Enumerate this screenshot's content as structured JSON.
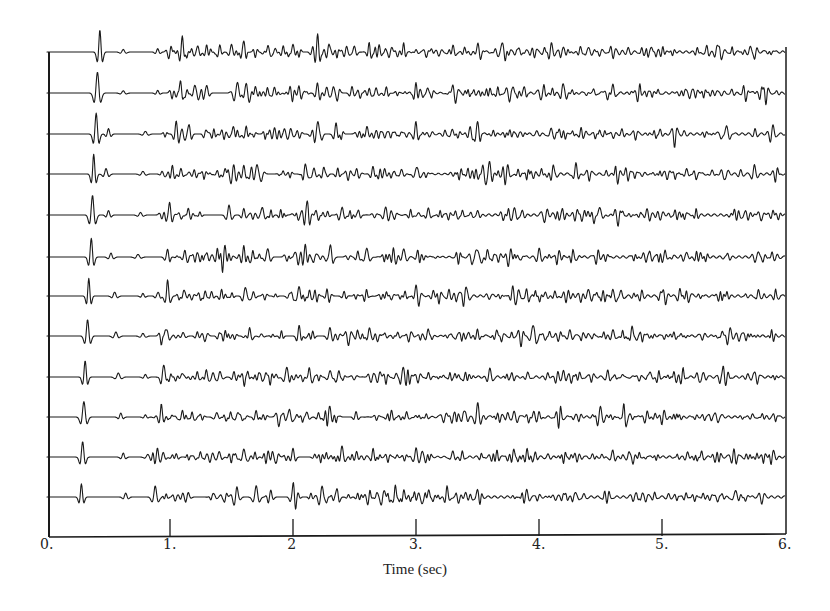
{
  "chart_data": {
    "type": "line",
    "title": "",
    "xlabel": "Time (sec)",
    "ylabel": "",
    "xlim": [
      0,
      6
    ],
    "x_ticks": [
      0,
      1,
      2,
      3,
      4,
      5,
      6
    ],
    "x_tick_labels": [
      "0.",
      "1.",
      "2",
      "3.",
      "4.",
      "5.",
      "6."
    ],
    "grid": false,
    "legend": null,
    "trace_count": 12,
    "traces": [
      {
        "index": 1,
        "first_arrival": 0.43,
        "events": [
          [
            0.43,
            1.0
          ],
          [
            0.62,
            0.12
          ],
          [
            0.9,
            0.15
          ],
          [
            1.1,
            0.75
          ],
          [
            1.22,
            0.25
          ],
          [
            1.3,
            0.25
          ],
          [
            1.5,
            0.35
          ],
          [
            1.6,
            0.35
          ],
          [
            1.8,
            0.3
          ],
          [
            1.92,
            0.3
          ],
          [
            2.0,
            0.35
          ],
          [
            2.2,
            0.8
          ],
          [
            2.3,
            0.3
          ],
          [
            2.5,
            0.3
          ],
          [
            2.7,
            0.35
          ],
          [
            3.3,
            0.4
          ],
          [
            3.5,
            0.3
          ],
          [
            3.7,
            0.35
          ],
          [
            4.1,
            0.3
          ],
          [
            4.4,
            0.35
          ]
        ]
      },
      {
        "index": 2,
        "first_arrival": 0.41,
        "events": [
          [
            0.41,
            0.95
          ],
          [
            0.62,
            0.1
          ],
          [
            0.9,
            0.12
          ],
          [
            1.08,
            0.6
          ],
          [
            1.2,
            0.3
          ],
          [
            1.3,
            0.3
          ],
          [
            1.55,
            0.45
          ],
          [
            1.62,
            0.35
          ],
          [
            1.85,
            0.3
          ],
          [
            2.05,
            0.3
          ],
          [
            2.2,
            0.45
          ],
          [
            2.48,
            0.3
          ],
          [
            3.0,
            0.45
          ],
          [
            3.3,
            0.3
          ],
          [
            3.6,
            0.3
          ],
          [
            4.2,
            0.35
          ],
          [
            4.6,
            0.4
          ]
        ]
      },
      {
        "index": 3,
        "first_arrival": 0.4,
        "events": [
          [
            0.4,
            0.95
          ],
          [
            0.5,
            0.25
          ],
          [
            0.8,
            0.12
          ],
          [
            1.05,
            0.55
          ],
          [
            1.15,
            0.25
          ],
          [
            1.3,
            0.25
          ],
          [
            1.52,
            0.45
          ],
          [
            1.62,
            0.4
          ],
          [
            1.85,
            0.3
          ],
          [
            2.2,
            0.6
          ],
          [
            2.35,
            0.35
          ],
          [
            2.6,
            0.35
          ],
          [
            3.0,
            0.35
          ],
          [
            3.5,
            0.35
          ],
          [
            4.1,
            0.3
          ],
          [
            5.9,
            0.35
          ]
        ]
      },
      {
        "index": 4,
        "first_arrival": 0.38,
        "events": [
          [
            0.38,
            0.9
          ],
          [
            0.48,
            0.25
          ],
          [
            0.78,
            0.12
          ],
          [
            1.02,
            0.5
          ],
          [
            1.2,
            0.25
          ],
          [
            1.45,
            0.3
          ],
          [
            1.6,
            0.4
          ],
          [
            1.7,
            0.35
          ],
          [
            2.1,
            0.35
          ],
          [
            2.25,
            0.4
          ],
          [
            2.65,
            0.35
          ],
          [
            3.0,
            0.35
          ],
          [
            3.6,
            0.35
          ],
          [
            4.3,
            0.3
          ],
          [
            5.2,
            0.3
          ]
        ]
      },
      {
        "index": 5,
        "first_arrival": 0.37,
        "events": [
          [
            0.37,
            0.9
          ],
          [
            0.5,
            0.2
          ],
          [
            0.76,
            0.12
          ],
          [
            1.0,
            0.45
          ],
          [
            1.15,
            0.25
          ],
          [
            1.48,
            0.45
          ],
          [
            1.6,
            0.3
          ],
          [
            1.75,
            0.4
          ],
          [
            2.12,
            0.55
          ],
          [
            2.4,
            0.35
          ],
          [
            2.75,
            0.35
          ],
          [
            3.1,
            0.35
          ],
          [
            3.8,
            0.4
          ],
          [
            4.5,
            0.3
          ]
        ]
      },
      {
        "index": 6,
        "first_arrival": 0.36,
        "events": [
          [
            0.36,
            0.85
          ],
          [
            0.52,
            0.18
          ],
          [
            0.74,
            0.12
          ],
          [
            0.98,
            0.45
          ],
          [
            1.12,
            0.25
          ],
          [
            1.45,
            0.35
          ],
          [
            1.6,
            0.3
          ],
          [
            1.8,
            0.35
          ],
          [
            2.1,
            0.6
          ],
          [
            2.3,
            0.35
          ],
          [
            2.6,
            0.4
          ],
          [
            2.9,
            0.35
          ],
          [
            3.5,
            0.4
          ],
          [
            4.0,
            0.35
          ],
          [
            4.9,
            0.3
          ]
        ]
      },
      {
        "index": 7,
        "first_arrival": 0.34,
        "events": [
          [
            0.34,
            0.8
          ],
          [
            0.55,
            0.18
          ],
          [
            0.78,
            0.12
          ],
          [
            0.98,
            0.45
          ],
          [
            1.12,
            0.25
          ],
          [
            1.42,
            0.35
          ],
          [
            1.62,
            0.3
          ],
          [
            2.05,
            0.45
          ],
          [
            2.28,
            0.35
          ],
          [
            2.6,
            0.4
          ],
          [
            3.0,
            0.4
          ],
          [
            3.4,
            0.35
          ],
          [
            3.9,
            0.4
          ],
          [
            4.4,
            0.3
          ]
        ]
      },
      {
        "index": 8,
        "first_arrival": 0.33,
        "events": [
          [
            0.33,
            0.75
          ],
          [
            0.56,
            0.18
          ],
          [
            0.78,
            0.12
          ],
          [
            0.97,
            0.45
          ],
          [
            1.1,
            0.25
          ],
          [
            1.45,
            0.35
          ],
          [
            1.65,
            0.3
          ],
          [
            2.05,
            0.5
          ],
          [
            2.3,
            0.35
          ],
          [
            2.62,
            0.4
          ],
          [
            3.1,
            0.35
          ],
          [
            3.5,
            0.35
          ],
          [
            3.95,
            0.5
          ],
          [
            4.6,
            0.3
          ]
        ]
      },
      {
        "index": 9,
        "first_arrival": 0.31,
        "events": [
          [
            0.31,
            0.75
          ],
          [
            0.58,
            0.18
          ],
          [
            0.8,
            0.12
          ],
          [
            0.95,
            0.5
          ],
          [
            1.1,
            0.2
          ],
          [
            1.35,
            0.2
          ],
          [
            1.52,
            0.25
          ],
          [
            1.72,
            0.3
          ],
          [
            1.95,
            0.45
          ],
          [
            2.3,
            0.35
          ],
          [
            2.9,
            0.35
          ],
          [
            3.6,
            0.4
          ],
          [
            4.2,
            0.3
          ],
          [
            4.9,
            0.3
          ]
        ]
      },
      {
        "index": 10,
        "first_arrival": 0.3,
        "events": [
          [
            0.3,
            0.7
          ],
          [
            0.6,
            0.18
          ],
          [
            0.8,
            0.1
          ],
          [
            0.93,
            0.5
          ],
          [
            1.1,
            0.2
          ],
          [
            1.38,
            0.2
          ],
          [
            1.55,
            0.25
          ],
          [
            1.7,
            0.3
          ],
          [
            1.97,
            0.45
          ],
          [
            2.3,
            0.35
          ],
          [
            2.8,
            0.35
          ],
          [
            3.5,
            0.45
          ],
          [
            4.0,
            0.3
          ],
          [
            4.5,
            0.3
          ]
        ]
      },
      {
        "index": 11,
        "first_arrival": 0.29,
        "events": [
          [
            0.29,
            0.7
          ],
          [
            0.62,
            0.18
          ],
          [
            0.82,
            0.12
          ],
          [
            0.9,
            0.45
          ],
          [
            1.05,
            0.2
          ],
          [
            1.4,
            0.25
          ],
          [
            1.6,
            0.35
          ],
          [
            1.8,
            0.3
          ],
          [
            2.0,
            0.4
          ],
          [
            2.4,
            0.35
          ],
          [
            3.0,
            0.4
          ],
          [
            3.3,
            0.3
          ],
          [
            3.9,
            0.4
          ],
          [
            4.6,
            0.3
          ]
        ]
      },
      {
        "index": 12,
        "first_arrival": 0.28,
        "events": [
          [
            0.28,
            0.6
          ],
          [
            0.64,
            0.18
          ],
          [
            0.88,
            0.5
          ],
          [
            1.1,
            0.15
          ],
          [
            1.35,
            0.2
          ],
          [
            1.55,
            0.25
          ],
          [
            1.7,
            0.35
          ],
          [
            1.82,
            0.25
          ],
          [
            2.0,
            0.55
          ],
          [
            2.35,
            0.3
          ],
          [
            2.75,
            0.35
          ],
          [
            3.1,
            0.35
          ],
          [
            3.5,
            0.3
          ],
          [
            3.9,
            0.3
          ],
          [
            4.3,
            0.25
          ]
        ]
      }
    ]
  },
  "axes": {
    "xlabel": "Time (sec)",
    "tick_labels": [
      "0.",
      "1.",
      "2",
      "3.",
      "4.",
      "5.",
      "6."
    ]
  }
}
